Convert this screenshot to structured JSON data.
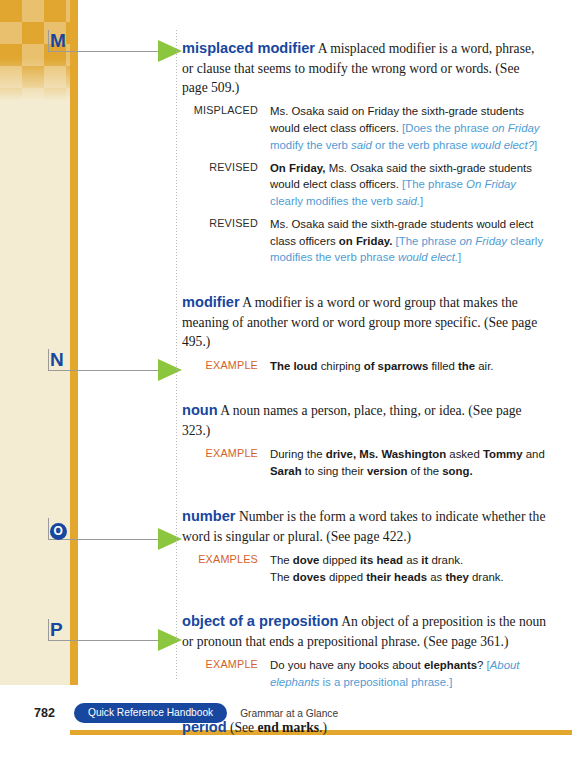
{
  "page": {
    "folio": "782",
    "running_head_pill": "Quick Reference Handbook",
    "running_head_sub": "Grammar at a Glance",
    "accent_gold": "#e3a72e",
    "accent_blue": "#17479e",
    "accent_note_blue": "#4f9bd4",
    "accent_orange": "#d4622a",
    "accent_green": "#8cc63e"
  },
  "letter_tabs": [
    {
      "letter": "M",
      "style": "plain"
    },
    {
      "letter": "N",
      "style": "plain"
    },
    {
      "letter": "O",
      "style": "circled"
    },
    {
      "letter": "P",
      "style": "plain"
    }
  ],
  "entries": [
    {
      "headword": "misplaced modifier",
      "definition": " A misplaced modifier is a word, phrase, or clause that seems to modify the wrong word or words. (See page 509.)",
      "examples": [
        {
          "label": "MISPLACED",
          "label_accent": false,
          "lines": [
            "Ms. Osaka said on Friday the sixth-grade students would elect class officers.",
            "[Does the phrase on Friday modify the verb said or the verb phrase would elect?]"
          ]
        },
        {
          "label": "REVISED",
          "label_accent": false,
          "lines": [
            "On Friday, Ms. Osaka said the sixth-grade students would elect class officers.",
            "[The phrase On Friday clearly modifies the verb said.]"
          ]
        },
        {
          "label": "REVISED",
          "label_accent": false,
          "lines": [
            "Ms. Osaka said the sixth-grade students would elect class officers on Friday.",
            "[The phrase on Friday clearly modifies the verb phrase would elect.]"
          ]
        }
      ]
    },
    {
      "headword": "modifier",
      "definition": " A modifier is a word or word group that makes the meaning of another word or word group more specific. (See page 495.)",
      "examples": [
        {
          "label": "EXAMPLE",
          "label_accent": true,
          "lines": [
            "The loud chirping of sparrows filled the air."
          ]
        }
      ]
    },
    {
      "headword": "noun",
      "definition": " A noun names a person, place, thing, or idea. (See page 323.)",
      "examples": [
        {
          "label": "EXAMPLE",
          "label_accent": true,
          "lines": [
            "During the drive, Ms. Washington asked Tommy and Sarah to sing their version of the song."
          ]
        }
      ]
    },
    {
      "headword": "number",
      "definition": " Number is the form a word takes to indicate whether the word is singular or plural. (See page 422.)",
      "examples": [
        {
          "label": "EXAMPLES",
          "label_accent": true,
          "lines": [
            "The dove dipped its head as it drank.",
            "The doves dipped their heads as they drank."
          ]
        }
      ]
    },
    {
      "headword": "object of a preposition",
      "definition": " An object of a preposition is the noun or pronoun that ends a prepositional phrase. (See page 361.)",
      "examples": [
        {
          "label": "EXAMPLE",
          "label_accent": true,
          "lines": [
            "Do you have any books about elephants?",
            "[About elephants is a prepositional phrase.]"
          ]
        }
      ]
    },
    {
      "headword": "period",
      "definition": " (See end marks.)",
      "definition_ref": "end marks",
      "examples": []
    }
  ]
}
